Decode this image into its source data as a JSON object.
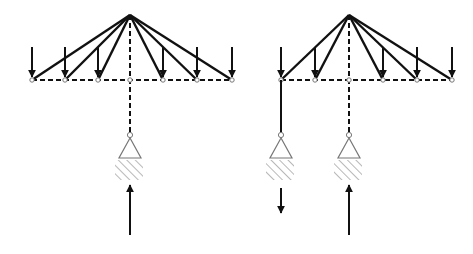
{
  "colors": {
    "line": "#111111",
    "support": "#777777",
    "hatch": "#999999",
    "background": "#ffffff"
  },
  "diagrams": [
    {
      "id": "left",
      "apex": [
        130,
        15
      ],
      "chord_y": 80,
      "nodes_x": [
        32,
        65,
        98,
        130,
        163,
        197,
        232
      ],
      "solid_members_to": [
        32,
        65,
        98,
        163,
        197,
        232
      ],
      "dashed_vertical": {
        "x": 130,
        "y1": 15,
        "y2": 132
      },
      "load_arrows_x": [
        32,
        65,
        98,
        163,
        197,
        232
      ],
      "supports": [
        {
          "x": 130,
          "pin_y": 135,
          "link_style": "dashed",
          "reaction": "up",
          "reaction_y": [
            185,
            235
          ]
        }
      ]
    },
    {
      "id": "right",
      "apex": [
        349,
        15
      ],
      "chord_y": 80,
      "nodes_x": [
        281,
        315,
        349,
        383,
        417,
        452
      ],
      "solid_members_to": [
        281,
        315,
        383,
        417,
        452
      ],
      "dashed_vertical": {
        "x": 349,
        "y1": 15,
        "y2": 132
      },
      "load_arrows_x": [
        281,
        315,
        383,
        417,
        452
      ],
      "supports": [
        {
          "x": 281,
          "pin_y": 135,
          "link_style": "solid",
          "reaction": "down",
          "reaction_y": [
            188,
            213
          ]
        },
        {
          "x": 349,
          "pin_y": 135,
          "link_style": "dashed",
          "reaction": "up",
          "reaction_y": [
            185,
            235
          ]
        }
      ]
    }
  ]
}
